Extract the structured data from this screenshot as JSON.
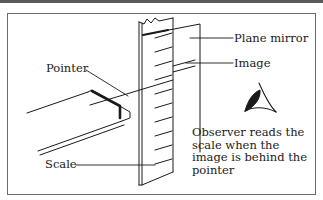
{
  "figure": {
    "type": "parallax-free scale reading diagram",
    "colors": {
      "ink": "#1a1a1a",
      "frame": "#6b6b6b",
      "topbar": "#5a5a5a",
      "background": "#ffffff"
    },
    "labels": {
      "plane_mirror": "Plane mirror",
      "image": "Image",
      "pointer": "Pointer",
      "scale": "Scale"
    },
    "observer_caption": {
      "lines": [
        "Observer reads the",
        "scale when the",
        "image is behind the",
        "pointer"
      ]
    },
    "icons": {
      "eye": "eye-icon"
    }
  }
}
